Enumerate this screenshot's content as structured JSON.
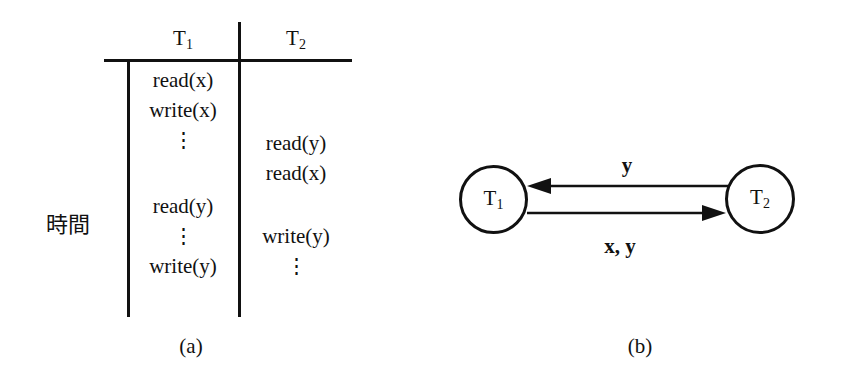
{
  "figure": {
    "panels": [
      {
        "id": "a",
        "caption": "(a)"
      },
      {
        "id": "b",
        "caption": "(b)"
      }
    ],
    "colors": {
      "ink": "#111111",
      "background": "#ffffff"
    }
  },
  "schedule": {
    "axis_label": "時間",
    "columns": [
      {
        "name": "T1",
        "base": "T",
        "sub": "1"
      },
      {
        "name": "T2",
        "base": "T",
        "sub": "2"
      }
    ],
    "t1_operations": [
      "read(x)",
      "write(x)",
      "⋮",
      "",
      "read(y)",
      "⋮",
      "write(y)"
    ],
    "t2_operations": [
      "",
      "",
      "read(y)",
      "read(x)",
      "",
      "write(y)",
      "⋮"
    ],
    "caption": "(a)"
  },
  "precedence_graph": {
    "nodes": [
      {
        "id": "T1",
        "base": "T",
        "sub": "1"
      },
      {
        "id": "T2",
        "base": "T",
        "sub": "2"
      }
    ],
    "edges": [
      {
        "from": "T2",
        "to": "T1",
        "label": "y",
        "position": "top"
      },
      {
        "from": "T1",
        "to": "T2",
        "label": "x, y",
        "position": "bottom"
      }
    ],
    "caption": "(b)"
  }
}
